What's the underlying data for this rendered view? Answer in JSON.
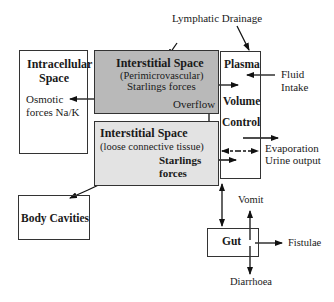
{
  "diagram": {
    "lymphatic_drainage": "Lymphatic Drainage",
    "intracellular": {
      "title_line1": "Intracellular",
      "title_line2": "Space",
      "text_line1": "Osmotic",
      "text_line2": "forces Na/K"
    },
    "interstitial_upper": {
      "title": "Interstitial Space",
      "subtitle": "(Perimicrovascular)",
      "text": "Starlings forces",
      "overflow": "Overflow",
      "fill": "#b9b9b9"
    },
    "interstitial_lower": {
      "title": "Interstitial Space",
      "subtitle": "(loose connective tissue)",
      "text_line1": "Starlings",
      "text_line2": "forces",
      "fill": "#e3e3e3"
    },
    "plasma": {
      "line1": "Plasma",
      "line2": "Volume",
      "line3": "Control"
    },
    "fluid_intake": {
      "line1": "Fluid",
      "line2": "Intake"
    },
    "evaporation": {
      "line1": "Evaporation",
      "line2": "Urine output"
    },
    "body_cavities": "Body Cavities",
    "gut": "Gut",
    "vomit": "Vomit",
    "fistulae": "Fistulae",
    "diarrhoea": "Diarrhoea"
  }
}
